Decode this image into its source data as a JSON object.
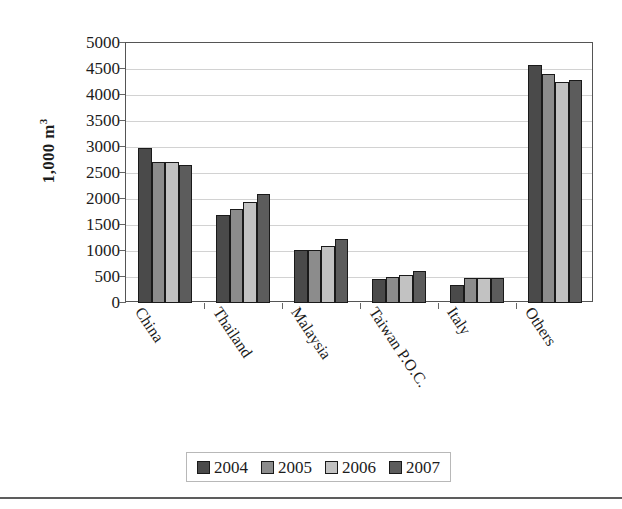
{
  "chart_data": {
    "type": "bar",
    "title": "",
    "xlabel": "",
    "ylabel": "1,000 m3",
    "ylabel_base": "1,000 m",
    "ylabel_sup": "3",
    "categories": [
      "China",
      "Thailand",
      "Malaysia",
      "Taiwan P.O.C.",
      "Italy",
      "Others"
    ],
    "series": [
      {
        "name": "2004",
        "color": "#4a4a4a",
        "values": [
          2980,
          1700,
          1020,
          470,
          340,
          4570
        ]
      },
      {
        "name": "2005",
        "color": "#8c8c8c",
        "values": [
          2720,
          1800,
          1020,
          500,
          490,
          4400
        ]
      },
      {
        "name": "2006",
        "color": "#c2c2c2",
        "values": [
          2710,
          1950,
          1100,
          540,
          490,
          4250
        ]
      },
      {
        "name": "2007",
        "color": "#5c5c5c",
        "values": [
          2650,
          2100,
          1230,
          620,
          490,
          4280
        ]
      }
    ],
    "ylim": [
      0,
      5000
    ],
    "ytick_step": 500,
    "yticks": [
      0,
      500,
      1000,
      1500,
      2000,
      2500,
      3000,
      3500,
      4000,
      4500,
      5000
    ],
    "ytick_labels": [
      "0",
      "500",
      "1000",
      "1500",
      "2000",
      "2500",
      "3000",
      "3500",
      "4000",
      "4500",
      "5000"
    ],
    "grid": true,
    "grid_axis": "y",
    "legend_position": "bottom",
    "legend_entries": [
      "2004",
      "2005",
      "2006",
      "2007"
    ]
  }
}
